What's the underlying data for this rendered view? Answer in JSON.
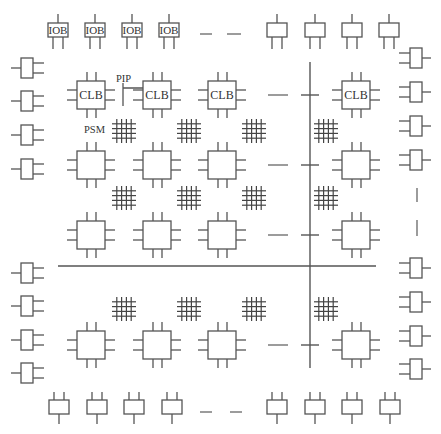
{
  "diagram": {
    "colors": {
      "stroke": "#555555",
      "background": "#ffffff",
      "text": "#333333"
    },
    "labels": {
      "iob": "IOB",
      "clb": "CLB",
      "pip": "PIP",
      "psm": "PSM"
    },
    "top_iobs": [
      {
        "x": 58,
        "label": "IOB"
      },
      {
        "x": 95,
        "label": "IOB"
      },
      {
        "x": 132,
        "label": "IOB"
      },
      {
        "x": 169,
        "label": "IOB"
      },
      {
        "x": 277,
        "label": ""
      },
      {
        "x": 315,
        "label": ""
      },
      {
        "x": 352,
        "label": ""
      },
      {
        "x": 389,
        "label": ""
      }
    ],
    "bottom_iobs": [
      59,
      97,
      134,
      172,
      277,
      315,
      352,
      390
    ],
    "left_iobs": [
      68,
      101,
      135,
      169,
      273,
      306,
      340,
      373
    ],
    "right_iobs": [
      58,
      92,
      126,
      160,
      268,
      302,
      336,
      369
    ],
    "clb_columns": [
      91,
      157,
      222,
      356
    ],
    "clb_rows": [
      95,
      165,
      235,
      345
    ],
    "clb_labeled": [
      {
        "col": 0,
        "row": 0,
        "label": "CLB"
      },
      {
        "col": 1,
        "row": 0,
        "label": "CLB"
      },
      {
        "col": 2,
        "row": 0,
        "label": "CLB"
      },
      {
        "col": 3,
        "row": 0,
        "label": "CLB"
      }
    ],
    "psm_positions": [
      [
        124,
        131
      ],
      [
        189,
        131
      ],
      [
        254,
        131
      ],
      [
        326,
        131
      ],
      [
        124,
        198
      ],
      [
        189,
        198
      ],
      [
        254,
        198
      ],
      [
        326,
        198
      ],
      [
        124,
        309
      ],
      [
        189,
        309
      ],
      [
        254,
        309
      ],
      [
        326,
        309
      ]
    ],
    "long_lines": {
      "horizontal": {
        "y": 266,
        "x1": 58,
        "x2": 376
      },
      "vertical": {
        "x": 310,
        "y1": 62,
        "y2": 368
      }
    },
    "annotations": {
      "pip": {
        "text": "PIP",
        "x": 116,
        "y": 82
      },
      "psm": {
        "text": "PSM",
        "x": 84,
        "y": 133
      }
    }
  }
}
